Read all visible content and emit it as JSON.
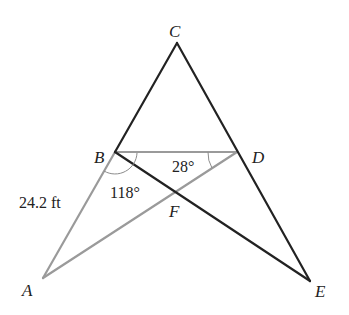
{
  "diagram": {
    "type": "geometry",
    "points": {
      "A": {
        "label": "A"
      },
      "B": {
        "label": "B"
      },
      "C": {
        "label": "C"
      },
      "D": {
        "label": "D"
      },
      "E": {
        "label": "E"
      },
      "F": {
        "label": "F"
      }
    },
    "segments": {
      "dark": [
        "CB",
        "CE",
        "BE"
      ],
      "light": [
        "BD",
        "BA",
        "AD"
      ]
    },
    "measurements": {
      "side_AB": "24.2 ft",
      "angle_ABF": "118°",
      "angle_BDF": "28°"
    },
    "colors": {
      "dark_line": "#222222",
      "light_line": "#9a9a9a",
      "background": "#ffffff"
    }
  }
}
